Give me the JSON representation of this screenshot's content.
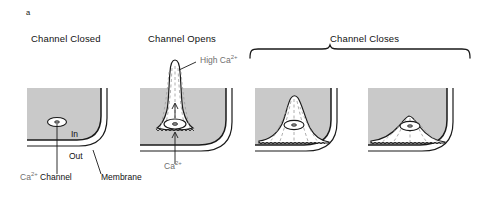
{
  "figure": {
    "letter": "a",
    "type": "biological-diagram",
    "cytoplasm_color": "#c9c9c9",
    "line_color": "#1a1a1a",
    "background": "#ffffff"
  },
  "panels": [
    {
      "id": "panel-1",
      "title": "Channel Closed",
      "title_x": 31,
      "title_y": 40,
      "state": "closed",
      "plume": "none",
      "labels": [
        {
          "name": "in-label",
          "text": "In",
          "x": 71,
          "y": 136
        },
        {
          "name": "out-label",
          "text": "Out",
          "x": 69,
          "y": 158
        },
        {
          "name": "ca-channel-label",
          "text_main": "Ca",
          "text_sup": "2+",
          "text_tail": " Channel",
          "x": 20,
          "y": 178
        },
        {
          "name": "membrane-label",
          "text": "Membrane",
          "x": 101,
          "y": 178
        }
      ]
    },
    {
      "id": "panel-2",
      "title": "Channel Opens",
      "title_x": 148,
      "title_y": 40,
      "state": "open",
      "plume": "tall-narrow-spike",
      "labels": [
        {
          "name": "high-ca-label",
          "text_main": "High Ca",
          "text_sup": "2+",
          "x": 200,
          "y": 62
        },
        {
          "name": "ca-influx-label",
          "text_main": "Ca",
          "text_sup": "2+",
          "x": 163,
          "y": 168
        }
      ]
    },
    {
      "id": "panel-3",
      "title": "",
      "state": "closing-1",
      "plume": "bell-dome-tall",
      "labels": []
    },
    {
      "id": "panel-4",
      "title": "",
      "state": "closing-2",
      "plume": "bell-dome-flat",
      "labels": []
    }
  ],
  "brace": {
    "name": "channel-closes-brace",
    "title": "Channel Closes",
    "title_x": 330,
    "title_y": 40,
    "span_left": 250,
    "span_right": 470,
    "y": 52
  }
}
